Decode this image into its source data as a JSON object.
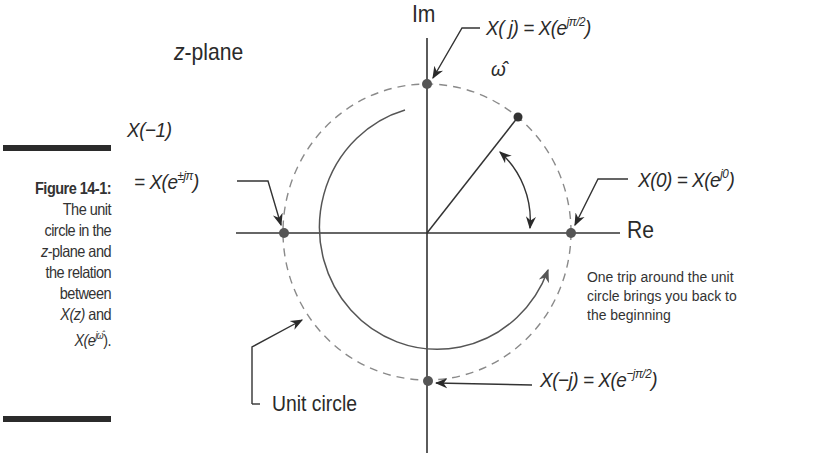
{
  "caption": {
    "figure_label": "Figure 14-1:",
    "line1": "The unit",
    "line2": "circle in the",
    "line3_italic": "z",
    "line3_rest": "-plane and",
    "line4": "the relation",
    "line5": "between",
    "line6_math": "X(z)",
    "line6_rest": " and",
    "line7_math": "X(e",
    "line7_sup": "jω̂",
    "line7_end": ")."
  },
  "diagram": {
    "plane_label_italic": "z",
    "plane_label_rest": "-plane",
    "axis_imag": "Im",
    "axis_real": "Re",
    "angle_symbol": "ω̂",
    "points": {
      "top": {
        "lhs": "X( j) = X(e",
        "sup": "jπ/2",
        "end": ")"
      },
      "left_line1": "X(−1)",
      "left_line2": {
        "lhs": "= X(e",
        "sup": "±jπ",
        "end": ")"
      },
      "right": {
        "lhs": "X(0) = X(e",
        "sup": "j0",
        "end": ")"
      },
      "bottom": {
        "lhs": "X(−j) = X(e",
        "sup": "−jπ/2",
        "end": ")"
      }
    },
    "note_lines": [
      "One trip around the unit",
      "circle brings you back to",
      "the beginning"
    ],
    "unit_circle_label": "Unit circle",
    "colors": {
      "ink": "#2a2a2a",
      "dashed_circle": "#8a8a8a",
      "point_fill": "#555555"
    }
  }
}
